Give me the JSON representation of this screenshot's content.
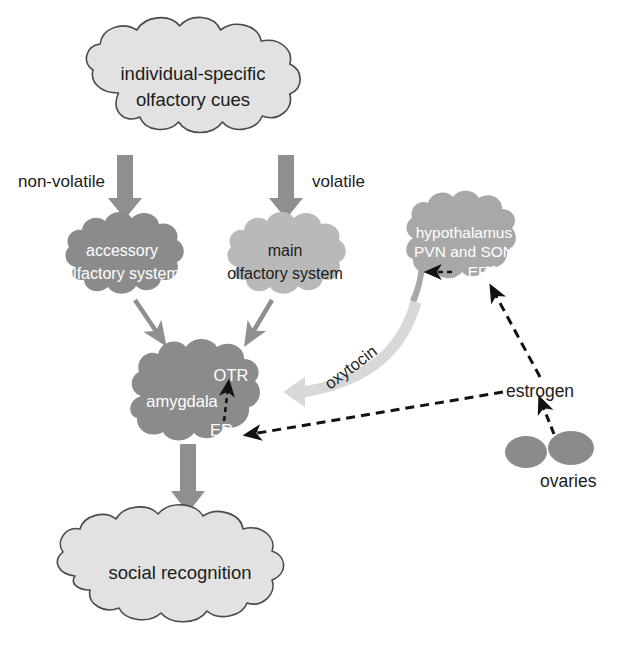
{
  "diagram": {
    "background": "#ffffff",
    "colors": {
      "cloud_light": "#e2e2e2",
      "cloud_light_stroke": "#4a4a4a",
      "cloud_dark": "#8b8b8b",
      "cloud_medium": "#a8a8a8",
      "cloud_mid_light": "#b9b9b9",
      "arrow_gray": "#8f8f8f",
      "arrow_pale": "#d8d8d8",
      "dashed_black": "#121212",
      "text_dark": "#1c1c1c",
      "text_light": "#ffffff"
    },
    "nodes": {
      "olfactory_cues": {
        "line1": "individual-specific",
        "line2": "olfactory cues",
        "fill": "#e2e2e2",
        "text_color": "#1c1c1c"
      },
      "accessory_olfactory": {
        "line1": "accessory",
        "line2": "olfactory system",
        "fill": "#8b8b8b",
        "text_color": "#ffffff"
      },
      "main_olfactory": {
        "line1": "main",
        "line2": "olfactory system",
        "fill": "#b9b9b9",
        "text_color": "#1c1c1c"
      },
      "hypothalamus": {
        "line1": "hypothalamus",
        "line2": "PVN and SON",
        "line3": "ERβ",
        "fill": "#a8a8a8",
        "text_color": "#ffffff"
      },
      "amygdala": {
        "line1": "amygdala",
        "receptor_top": "OTR",
        "receptor_bottom": "ERa",
        "fill": "#8b8b8b",
        "text_color": "#ffffff"
      },
      "social_recognition": {
        "line1": "social recognition",
        "fill": "#e2e2e2",
        "text_color": "#1c1c1c"
      },
      "ovaries": {
        "label": "ovaries",
        "fill": "#8b8b8b",
        "text_color": "#1c1c1c"
      },
      "estrogen": {
        "label": "estrogen",
        "text_color": "#1c1c1c"
      }
    },
    "edges": {
      "non_volatile": {
        "label": "non-volatile",
        "style": "solid-gray-arrow"
      },
      "volatile": {
        "label": "volatile",
        "style": "solid-gray-arrow"
      },
      "oxytocin": {
        "label": "oxytocin",
        "style": "curved-pale-arrow"
      },
      "accessory_to_amygdala": {
        "label": "",
        "style": "solid-gray-arrow"
      },
      "main_to_amygdala": {
        "label": "",
        "style": "solid-gray-arrow"
      },
      "amygdala_to_social": {
        "label": "",
        "style": "solid-gray-arrow"
      },
      "estrogen_to_era": {
        "label": "",
        "style": "dashed-black-arrow"
      },
      "estrogen_to_erbeta": {
        "label": "",
        "style": "dashed-black-arrow"
      },
      "ovaries_to_estrogen": {
        "label": "",
        "style": "dashed-black-arrow"
      },
      "era_to_otr": {
        "label": "",
        "style": "dashed-black-arrow"
      },
      "erbeta_internal": {
        "label": "",
        "style": "dashed-black-arrow"
      }
    }
  }
}
